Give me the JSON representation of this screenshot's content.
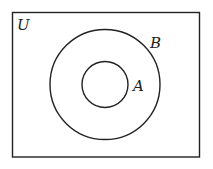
{
  "diagram": {
    "type": "venn",
    "universe_label": "U",
    "sets": [
      {
        "label": "B",
        "contains": "A"
      },
      {
        "label": "A",
        "subset_of": "B"
      }
    ],
    "stroke_color": "#222222",
    "background": "#ffffff"
  }
}
